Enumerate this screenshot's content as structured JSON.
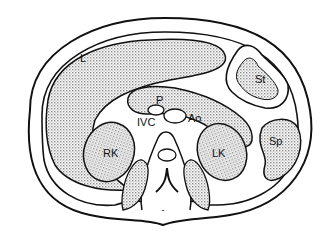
{
  "diagram": {
    "type": "anatomical cross-section",
    "labels": {
      "liver": "L",
      "stomach": "St",
      "pancreas": "P",
      "ivc": "IVC",
      "aorta": "Ao",
      "right_kidney": "RK",
      "left_kidney": "LK",
      "spleen": "Sp"
    },
    "colors": {
      "outline": "#111111",
      "fill_dots": "#8a8a8a",
      "background": "#ffffff"
    }
  }
}
